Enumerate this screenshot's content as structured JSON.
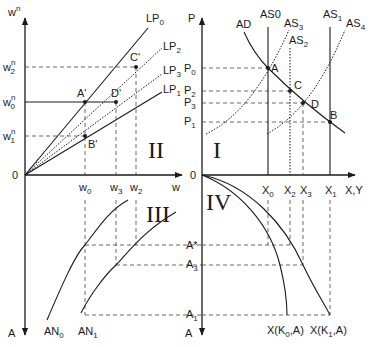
{
  "figure": {
    "panels": [
      {
        "id": "II",
        "label": "II",
        "x_axis": "w",
        "y_axis": "wⁿ"
      },
      {
        "id": "I",
        "label": "I",
        "x_axis": "X,Y",
        "y_axis": "P"
      },
      {
        "id": "III",
        "label": "III",
        "x_axis": "w",
        "y_axis": "A"
      },
      {
        "id": "IV",
        "label": "IV",
        "x_axis": "X,Y",
        "y_axis": "A"
      }
    ],
    "origin_label": "0",
    "panel_II": {
      "y_axis_label": "w",
      "y_axis_sup": "n",
      "x_axis_label": "w",
      "y_ticks": [
        {
          "base": "w",
          "sup": "n",
          "sub": "2"
        },
        {
          "base": "w",
          "sup": "n",
          "sub": "0"
        },
        {
          "base": "w",
          "sup": "n",
          "sub": "1"
        }
      ],
      "x_ticks": [
        {
          "base": "w",
          "sub": "0"
        },
        {
          "base": "w",
          "sub": "3"
        },
        {
          "base": "w",
          "sub": "2"
        }
      ],
      "lines": [
        {
          "base": "LP",
          "sub": "0"
        },
        {
          "base": "LP",
          "sub": "2"
        },
        {
          "base": "LP",
          "sub": "3"
        },
        {
          "base": "LP",
          "sub": "1"
        }
      ],
      "points": [
        "A'",
        "D'",
        "C'",
        "B'"
      ]
    },
    "panel_I": {
      "y_axis_label": "P",
      "x_axis_label": "X,Y",
      "y_ticks": [
        {
          "base": "P",
          "sub": "0"
        },
        {
          "base": "P",
          "sub": "2"
        },
        {
          "base": "P",
          "sub": "3"
        },
        {
          "base": "P",
          "sub": "1"
        }
      ],
      "x_ticks": [
        {
          "base": "X",
          "sub": "0"
        },
        {
          "base": "X",
          "sub": "2"
        },
        {
          "base": "X",
          "sub": "3"
        },
        {
          "base": "X",
          "sub": "1"
        }
      ],
      "curves": [
        {
          "base": "AD",
          "sub": ""
        },
        {
          "base": "AS",
          "sub": "0"
        },
        {
          "base": "AS",
          "sub": "3"
        },
        {
          "base": "AS",
          "sub": "2"
        },
        {
          "base": "AS",
          "sub": "1"
        },
        {
          "base": "AS",
          "sub": "4"
        }
      ],
      "points": [
        "A",
        "C",
        "D",
        "B"
      ]
    },
    "panel_III": {
      "curves": [
        {
          "base": "AN",
          "sub": "0"
        },
        {
          "base": "AN",
          "sub": "1"
        }
      ],
      "y_ticks": [
        {
          "base": "A*",
          "sub": ""
        },
        {
          "base": "A",
          "sub": "3"
        },
        {
          "base": "A",
          "sub": "1"
        }
      ],
      "y_axis_label": "A"
    },
    "panel_IV": {
      "curves": [
        {
          "label": "X(K",
          "sub": "0",
          "tail": ",A)"
        },
        {
          "label": "X(K",
          "sub": "1",
          "tail": ",A)"
        }
      ],
      "y_ticks": [
        {
          "base": "A*",
          "sub": ""
        },
        {
          "base": "A",
          "sub": "3"
        },
        {
          "base": "A",
          "sub": "1"
        }
      ],
      "y_axis_label": "A"
    }
  }
}
